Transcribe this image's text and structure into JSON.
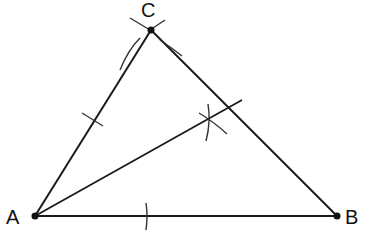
{
  "diagram": {
    "points": {
      "A": {
        "label": "A",
        "x": 35,
        "y": 216
      },
      "B": {
        "label": "B",
        "x": 337,
        "y": 216
      },
      "C": {
        "label": "C",
        "x": 151,
        "y": 30
      }
    },
    "segments": [
      {
        "from": "A",
        "to": "B"
      },
      {
        "from": "A",
        "to": "C"
      },
      {
        "from": "C",
        "to": "B"
      }
    ],
    "bisector": {
      "from": "A",
      "to_x": 242,
      "to_y": 100
    },
    "colors": {
      "line": "#1a1a1a",
      "arc": "#333333"
    }
  }
}
